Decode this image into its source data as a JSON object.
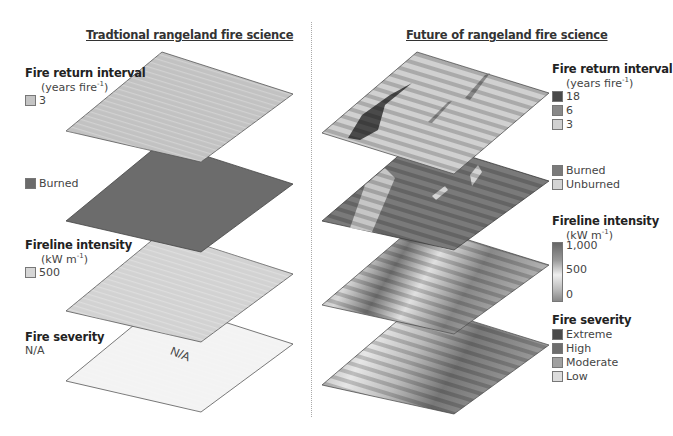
{
  "left_panel": {
    "title": "Tradtional rangeland fire science",
    "layers": [
      {
        "heading": "Fire return interval",
        "units": "(years fire",
        "units_sup": "-1",
        "units_end": ")",
        "legend": [
          {
            "label": "3",
            "color": "#c4c4c4"
          }
        ]
      },
      {
        "heading": "",
        "legend": [
          {
            "label": "Burned",
            "color": "#6b6b6b"
          }
        ]
      },
      {
        "heading": "Fireline intensity",
        "units": "(kW m",
        "units_sup": "-1",
        "units_end": ")",
        "legend": [
          {
            "label": "500",
            "color": "#d6d6d6"
          }
        ]
      },
      {
        "heading": "Fire severity",
        "value": "N/A",
        "plate_label": "N/A"
      }
    ]
  },
  "right_panel": {
    "title": "Future of rangeland fire science",
    "layers": [
      {
        "heading": "Fire return interval",
        "units": "(years fire",
        "units_sup": "-1",
        "units_end": ")",
        "legend": [
          {
            "label": "18",
            "color": "#4a4a4a"
          },
          {
            "label": "6",
            "color": "#888888"
          },
          {
            "label": "3",
            "color": "#d0d0d0"
          }
        ]
      },
      {
        "heading": "",
        "legend": [
          {
            "label": "Burned",
            "color": "#7a7a7a"
          },
          {
            "label": "Unburned",
            "color": "#d4d4d4"
          }
        ]
      },
      {
        "heading": "Fireline intensity",
        "units": "(kW m",
        "units_sup": "-1",
        "units_end": ")",
        "scale": [
          "1,000",
          "500",
          "0"
        ]
      },
      {
        "heading": "Fire severity",
        "legend": [
          {
            "label": "Extreme",
            "color": "#4a4a4a"
          },
          {
            "label": "High",
            "color": "#6e6e6e"
          },
          {
            "label": "Moderate",
            "color": "#a0a0a0"
          },
          {
            "label": "Low",
            "color": "#dcdcdc"
          }
        ]
      }
    ]
  },
  "colors": {
    "plate_frir": "#c2c2c2",
    "plate_burned": "#6c6c6c",
    "plate_intensity": "#d2d2d2",
    "plate_severity": "#f2f2f2"
  }
}
